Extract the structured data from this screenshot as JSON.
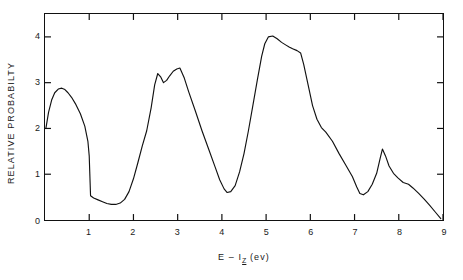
{
  "chart_data": {
    "type": "line",
    "title": "",
    "xlabel": "E - I_Z (ev)",
    "xlabel_parts": {
      "lead": "E – I",
      "sub": "Z",
      "tail": " (ev)"
    },
    "ylabel": "RELATIVE PROBABILTY",
    "xlim": [
      0,
      9
    ],
    "ylim": [
      0,
      4.5
    ],
    "xticks": [
      1,
      2,
      3,
      4,
      5,
      6,
      7,
      8,
      9
    ],
    "yticks": [
      0,
      1,
      2,
      3,
      4
    ],
    "xtick_labels": [
      "1",
      "2",
      "3",
      "4",
      "5",
      "6",
      "7",
      "8",
      "9"
    ],
    "ytick_labels": [
      "0",
      "1",
      "2",
      "3",
      "4"
    ],
    "grid": false,
    "legend": null,
    "line_color": "#111111",
    "background_color": "#ffffff",
    "series": [
      {
        "name": "relative probability",
        "x": [
          0.02,
          0.08,
          0.15,
          0.22,
          0.3,
          0.38,
          0.45,
          0.52,
          0.6,
          0.7,
          0.8,
          0.9,
          0.97,
          1.0,
          1.03,
          1.1,
          1.2,
          1.3,
          1.4,
          1.5,
          1.6,
          1.7,
          1.8,
          1.9,
          2.0,
          2.1,
          2.2,
          2.3,
          2.4,
          2.48,
          2.55,
          2.62,
          2.68,
          2.75,
          2.82,
          2.9,
          2.98,
          3.05,
          3.15,
          3.25,
          3.4,
          3.55,
          3.7,
          3.85,
          3.95,
          4.05,
          4.12,
          4.2,
          4.3,
          4.4,
          4.5,
          4.6,
          4.7,
          4.8,
          4.9,
          4.97,
          5.05,
          5.15,
          5.25,
          5.35,
          5.45,
          5.52,
          5.6,
          5.7,
          5.78,
          5.85,
          5.95,
          6.05,
          6.15,
          6.25,
          6.35,
          6.5,
          6.65,
          6.8,
          6.95,
          7.05,
          7.12,
          7.2,
          7.3,
          7.4,
          7.5,
          7.58,
          7.63,
          7.7,
          7.78,
          7.88,
          7.98,
          8.1,
          8.22,
          8.32,
          8.45,
          8.58,
          8.7,
          8.82,
          8.95
        ],
        "y": [
          2.0,
          2.35,
          2.62,
          2.78,
          2.86,
          2.88,
          2.85,
          2.78,
          2.68,
          2.52,
          2.32,
          2.05,
          1.72,
          1.4,
          0.53,
          0.48,
          0.44,
          0.4,
          0.36,
          0.34,
          0.34,
          0.37,
          0.45,
          0.62,
          0.9,
          1.25,
          1.62,
          1.95,
          2.45,
          2.95,
          3.2,
          3.12,
          3.0,
          3.05,
          3.15,
          3.25,
          3.3,
          3.32,
          3.1,
          2.8,
          2.38,
          1.95,
          1.55,
          1.15,
          0.88,
          0.68,
          0.6,
          0.62,
          0.75,
          1.05,
          1.45,
          1.95,
          2.5,
          3.05,
          3.58,
          3.85,
          4.0,
          4.02,
          3.96,
          3.88,
          3.82,
          3.78,
          3.74,
          3.7,
          3.65,
          3.4,
          2.95,
          2.5,
          2.2,
          2.02,
          1.92,
          1.72,
          1.45,
          1.2,
          0.95,
          0.72,
          0.58,
          0.55,
          0.62,
          0.78,
          1.02,
          1.35,
          1.55,
          1.4,
          1.18,
          1.02,
          0.92,
          0.82,
          0.78,
          0.7,
          0.58,
          0.45,
          0.32,
          0.18,
          0.03
        ]
      }
    ]
  }
}
